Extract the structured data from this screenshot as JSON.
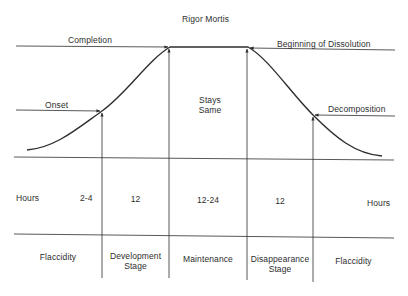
{
  "title": "Rigor Mortis",
  "curve_labels": {
    "completion": "Completion",
    "beginning_of_dissolution": "Beginning of Dissolution",
    "onset": "Onset",
    "decomposition": "Decomposition",
    "stays_same_line1": "Stays",
    "stays_same_line2": "Same"
  },
  "hours_row": {
    "label_left": "Hours",
    "label_right": "Hours",
    "values": [
      "2-4",
      "12",
      "12-24",
      "12"
    ]
  },
  "stages": [
    {
      "line1": "Flaccidity",
      "line2": ""
    },
    {
      "line1": "Development",
      "line2": "Stage"
    },
    {
      "line1": "Maintenance",
      "line2": ""
    },
    {
      "line1": "Disappearance",
      "line2": "Stage"
    },
    {
      "line1": "Flaccidity",
      "line2": ""
    }
  ],
  "colors": {
    "ink": "#2e2e2e",
    "background": "#ffffff"
  }
}
